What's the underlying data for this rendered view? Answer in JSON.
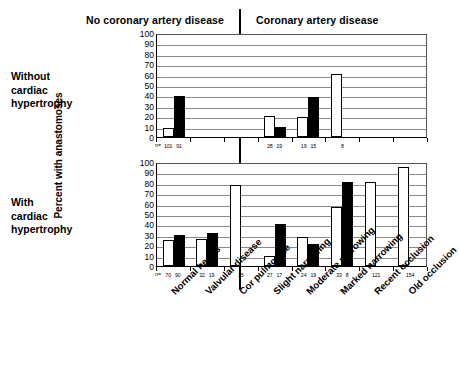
{
  "headers": {
    "left_group": "No coronary artery disease",
    "right_group": "Coronary artery disease"
  },
  "row_labels": {
    "without": "Without\ncardiac\nhypertrophy",
    "without_line1": "Without",
    "without_line2": "cardiac",
    "without_line3": "hypertrophy",
    "with_line1": "With",
    "with_line2": "cardiac",
    "with_line3": "hypertrophy"
  },
  "axis": {
    "y_title": "Percent with anastomoses",
    "n_prefix": "n="
  },
  "chart_data": [
    {
      "type": "bar",
      "title": "Without cardiac hypertrophy",
      "xlabel": "",
      "ylabel": "Percent with anastomoses",
      "ylim": [
        0,
        100
      ],
      "yticks": [
        0,
        10,
        20,
        30,
        40,
        50,
        60,
        70,
        80,
        90,
        100
      ],
      "grid": true,
      "categories": [
        "Normal hearts",
        "Valvular disease",
        "Cor pulmonale",
        "Slight narrowing",
        "Moderate narrowing",
        "Marked narrowing",
        "Recent occlusion",
        "Old occlusion"
      ],
      "group_split_after_category_index": 2,
      "series": [
        {
          "name": "open",
          "values": [
            9,
            null,
            null,
            20,
            19,
            61,
            null,
            null
          ]
        },
        {
          "name": "solid",
          "values": [
            39,
            null,
            null,
            10,
            38,
            null,
            null,
            null
          ]
        }
      ],
      "n_values": [
        [
          "101",
          "91"
        ],
        [],
        [],
        [
          "28",
          "19"
        ],
        [
          "19",
          "15"
        ],
        [
          "8"
        ],
        [],
        []
      ]
    },
    {
      "type": "bar",
      "title": "With cardiac hypertrophy",
      "xlabel": "",
      "ylabel": "Percent with anastomoses",
      "ylim": [
        0,
        100
      ],
      "yticks": [
        0,
        10,
        20,
        30,
        40,
        50,
        60,
        70,
        80,
        90,
        100
      ],
      "grid": true,
      "categories": [
        "Normal hearts",
        "Valvular disease",
        "Cor pulmonale",
        "Slight narrowing",
        "Moderate narrowing",
        "Marked narrowing",
        "Recent occlusion",
        "Old occlusion"
      ],
      "group_split_after_category_index": 2,
      "series": [
        {
          "name": "open",
          "values": [
            25,
            26,
            78,
            10,
            28,
            57,
            81,
            95
          ]
        },
        {
          "name": "solid",
          "values": [
            30,
            32,
            null,
            40,
            21,
            81,
            null,
            null
          ]
        }
      ],
      "n_values": [
        [
          "70",
          "90"
        ],
        [
          "32",
          "19"
        ],
        [
          "15"
        ],
        [
          "27",
          "17"
        ],
        [
          "24",
          "19"
        ],
        [
          "33",
          "8"
        ],
        [
          "121"
        ],
        [
          "154"
        ]
      ]
    }
  ],
  "colors": {
    "open_bar_fill": "#ffffff",
    "solid_bar_fill": "#000000",
    "bar_stroke": "#000000",
    "gridline": "#8a8a8a",
    "background": "#ffffff",
    "text": "#000000"
  }
}
